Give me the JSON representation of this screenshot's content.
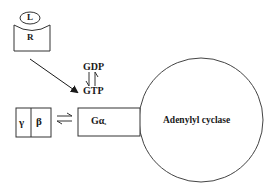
{
  "diagram": {
    "ligand": {
      "label": "L"
    },
    "receptor": {
      "label": "R"
    },
    "nucleotide_exchange": {
      "top_label": "GDP",
      "bottom_label": "GTP",
      "arrows": "reversible-harpoons"
    },
    "g_beta_gamma": {
      "gamma_label": "γ",
      "beta_label": "β"
    },
    "g_alpha": {
      "label": "Gα",
      "subscript": "s"
    },
    "effector": {
      "label": "Adenylyl cyclase"
    },
    "colors": {
      "stroke": "#333333",
      "text": "#1a1a1a",
      "background": "#ffffff"
    }
  }
}
